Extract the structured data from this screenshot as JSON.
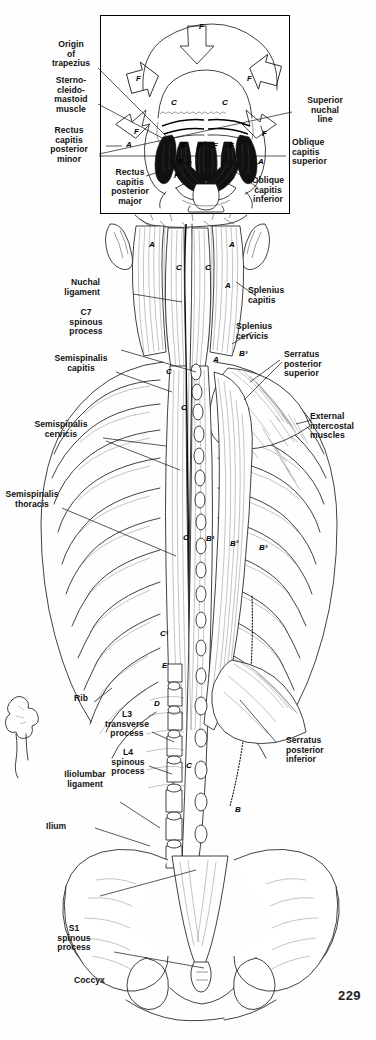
{
  "plate": {
    "title": "Deep muscles of the back — posterior view",
    "page_number": "229",
    "ink_color": "#111111",
    "paper_color": "#fefefe"
  },
  "inset": {
    "title": "Suboccipital region — posterior view of skull base",
    "labels_left": [
      {
        "id": "origin-of-trapezius",
        "text": "Origin\nof\ntrapezius"
      },
      {
        "id": "sternocleidomastoid-muscle",
        "text": "Sterno-\ncleido-\nmastoid\nmuscle"
      },
      {
        "id": "rectus-capitis-posterior-minor",
        "text": "Rectus\ncapitis\nposterior\nminor"
      },
      {
        "id": "rectus-capitis-posterior-major",
        "text": "Rectus\ncapitis\nposterior\nmajor"
      }
    ],
    "labels_right": [
      {
        "id": "superior-nuchal-line",
        "text": "Superior\nnuchal\nline"
      },
      {
        "id": "oblique-capitis-superior",
        "text": "Oblique\ncapitis\nsuperior"
      },
      {
        "id": "oblique-capitis-inferior",
        "text": "Oblique\ncapitis\ninferior"
      }
    ],
    "markers": [
      {
        "id": "inset-marker-f-top",
        "text": "F"
      },
      {
        "id": "inset-marker-f-left",
        "text": "F"
      },
      {
        "id": "inset-marker-f-right",
        "text": "F"
      },
      {
        "id": "inset-marker-f-arrow-left",
        "text": "F"
      },
      {
        "id": "inset-marker-f-arrow-right",
        "text": "F"
      },
      {
        "id": "inset-marker-c-left",
        "text": "C"
      },
      {
        "id": "inset-marker-c-right",
        "text": "C"
      },
      {
        "id": "inset-marker-a-left",
        "text": "A"
      },
      {
        "id": "inset-marker-a-right",
        "text": "A"
      },
      {
        "id": "inset-marker-f-m1",
        "text": "F"
      },
      {
        "id": "inset-marker-f-m2",
        "text": "F"
      },
      {
        "id": "inset-marker-f-m3",
        "text": "F"
      },
      {
        "id": "inset-marker-f-m4",
        "text": "F"
      },
      {
        "id": "inset-marker-f-m5",
        "text": "F"
      },
      {
        "id": "inset-marker-f-m6",
        "text": "F"
      }
    ]
  },
  "main": {
    "labels_left": [
      {
        "id": "nuchal-ligament",
        "text": "Nuchal\nligament"
      },
      {
        "id": "c7-spinous-process",
        "text": "C7\nspinous\nprocess"
      },
      {
        "id": "semispinalis-capitis",
        "text": "Semispinalis\ncapitis"
      },
      {
        "id": "semispinalis-cervicis",
        "text": "Semispinalis\ncervicis"
      },
      {
        "id": "semispinalis-thoracis",
        "text": "Semispinalis\nthoracis"
      },
      {
        "id": "rib",
        "text": "Rib"
      },
      {
        "id": "l3-transverse-process",
        "text": "L3\ntransverse\nprocess"
      },
      {
        "id": "l4-spinous-process",
        "text": "L4\nspinous\nprocess"
      },
      {
        "id": "iliolumbar-ligament",
        "text": "Iliolumbar\nligament"
      },
      {
        "id": "ilium",
        "text": "Ilium"
      },
      {
        "id": "s1-spinous-process",
        "text": "S1\nspinous\nprocess"
      },
      {
        "id": "coccyx",
        "text": "Coccyx"
      }
    ],
    "labels_right": [
      {
        "id": "splenius-capitis",
        "text": "Splenius\ncapitis"
      },
      {
        "id": "splenius-cervicis",
        "text": "Splenius\ncervicis"
      },
      {
        "id": "serratus-posterior-superior",
        "text": "Serratus\nposterior\nsuperior"
      },
      {
        "id": "external-intercostal-muscles",
        "text": "External\nintercostal\nmuscles"
      },
      {
        "id": "serratus-posterior-inferior",
        "text": "Serratus\nposterior\ninferior"
      }
    ],
    "markers": [
      {
        "id": "marker-a-left-neck",
        "text": "A"
      },
      {
        "id": "marker-a-right-neck",
        "text": "A"
      },
      {
        "id": "marker-c-neck-left",
        "text": "C"
      },
      {
        "id": "marker-c-neck-right",
        "text": "C"
      },
      {
        "id": "marker-a-splenius",
        "text": "A"
      },
      {
        "id": "marker-a-splenius-2",
        "text": "A"
      },
      {
        "id": "marker-b3-upper",
        "text": "B³"
      },
      {
        "id": "marker-c-mid-upper",
        "text": "C"
      },
      {
        "id": "marker-c-mid",
        "text": "C"
      },
      {
        "id": "marker-c-thoracic",
        "text": "C"
      },
      {
        "id": "marker-b1",
        "text": "B¹"
      },
      {
        "id": "marker-b2",
        "text": "B²"
      },
      {
        "id": "marker-b3",
        "text": "B³"
      },
      {
        "id": "marker-c1",
        "text": "C¹"
      },
      {
        "id": "marker-e",
        "text": "E"
      },
      {
        "id": "marker-d",
        "text": "D"
      },
      {
        "id": "marker-c-lumbar",
        "text": "C"
      },
      {
        "id": "marker-b-lumbar",
        "text": "B"
      }
    ]
  }
}
